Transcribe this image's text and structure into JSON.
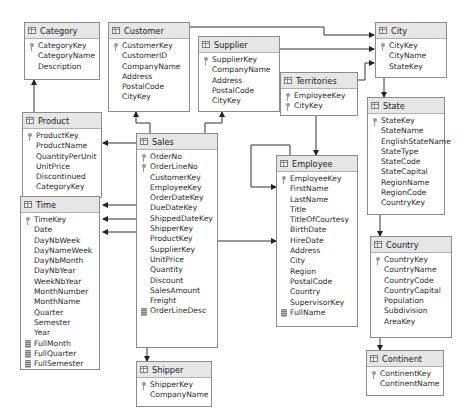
{
  "diagram": {
    "type": "database schema diagram",
    "tables": [
      {
        "id": "category",
        "name": "Category",
        "columns": [
          {
            "name": "CategoryKey",
            "icon": "key-icon"
          },
          {
            "name": "CategoryName",
            "icon": ""
          },
          {
            "name": "Description",
            "icon": ""
          }
        ]
      },
      {
        "id": "customer",
        "name": "Customer",
        "columns": [
          {
            "name": "CustomerKey",
            "icon": "key-icon"
          },
          {
            "name": "CustomerID",
            "icon": ""
          },
          {
            "name": "CompanyName",
            "icon": ""
          },
          {
            "name": "Address",
            "icon": ""
          },
          {
            "name": "PostalCode",
            "icon": ""
          },
          {
            "name": "CityKey",
            "icon": ""
          }
        ]
      },
      {
        "id": "supplier",
        "name": "Supplier",
        "columns": [
          {
            "name": "SupplierKey",
            "icon": "key-icon"
          },
          {
            "name": "CompanyName",
            "icon": ""
          },
          {
            "name": "Address",
            "icon": ""
          },
          {
            "name": "PostalCode",
            "icon": ""
          },
          {
            "name": "CityKey",
            "icon": ""
          }
        ]
      },
      {
        "id": "city",
        "name": "City",
        "columns": [
          {
            "name": "CityKey",
            "icon": "key-icon"
          },
          {
            "name": "CityName",
            "icon": ""
          },
          {
            "name": "StateKey",
            "icon": ""
          }
        ]
      },
      {
        "id": "territories",
        "name": "Territories",
        "columns": [
          {
            "name": "EmployeeKey",
            "icon": "key-icon"
          },
          {
            "name": "CityKey",
            "icon": "key-icon"
          }
        ]
      },
      {
        "id": "product",
        "name": "Product",
        "columns": [
          {
            "name": "ProductKey",
            "icon": "key-icon"
          },
          {
            "name": "ProductName",
            "icon": ""
          },
          {
            "name": "QuantityPerUnit",
            "icon": ""
          },
          {
            "name": "UnitPrice",
            "icon": ""
          },
          {
            "name": "Discontinued",
            "icon": ""
          },
          {
            "name": "CategoryKey",
            "icon": ""
          }
        ]
      },
      {
        "id": "sales",
        "name": "Sales",
        "columns": [
          {
            "name": "OrderNo",
            "icon": "key-icon"
          },
          {
            "name": "OrderLineNo",
            "icon": "key-icon"
          },
          {
            "name": "CustomerKey",
            "icon": ""
          },
          {
            "name": "EmployeeKey",
            "icon": ""
          },
          {
            "name": "OrderDateKey",
            "icon": ""
          },
          {
            "name": "DueDateKey",
            "icon": ""
          },
          {
            "name": "ShippedDateKey",
            "icon": ""
          },
          {
            "name": "ShipperKey",
            "icon": ""
          },
          {
            "name": "ProductKey",
            "icon": ""
          },
          {
            "name": "SupplierKey",
            "icon": ""
          },
          {
            "name": "UnitPrice",
            "icon": ""
          },
          {
            "name": "Quantity",
            "icon": ""
          },
          {
            "name": "Discount",
            "icon": ""
          },
          {
            "name": "SalesAmount",
            "icon": ""
          },
          {
            "name": "Freight",
            "icon": ""
          },
          {
            "name": "OrderLineDesc",
            "icon": "computed-column-icon"
          }
        ]
      },
      {
        "id": "state",
        "name": "State",
        "columns": [
          {
            "name": "StateKey",
            "icon": "key-icon"
          },
          {
            "name": "StateName",
            "icon": ""
          },
          {
            "name": "EnglishStateName",
            "icon": ""
          },
          {
            "name": "StateType",
            "icon": ""
          },
          {
            "name": "StateCode",
            "icon": ""
          },
          {
            "name": "StateCapital",
            "icon": ""
          },
          {
            "name": "RegionName",
            "icon": ""
          },
          {
            "name": "RegionCode",
            "icon": ""
          },
          {
            "name": "CountryKey",
            "icon": ""
          }
        ]
      },
      {
        "id": "employee",
        "name": "Employee",
        "columns": [
          {
            "name": "EmployeeKey",
            "icon": "key-icon"
          },
          {
            "name": "FirstName",
            "icon": ""
          },
          {
            "name": "LastName",
            "icon": ""
          },
          {
            "name": "Title",
            "icon": ""
          },
          {
            "name": "TitleOfCourtesy",
            "icon": ""
          },
          {
            "name": "BirthDate",
            "icon": ""
          },
          {
            "name": "HireDate",
            "icon": ""
          },
          {
            "name": "Address",
            "icon": ""
          },
          {
            "name": "City",
            "icon": ""
          },
          {
            "name": "Region",
            "icon": ""
          },
          {
            "name": "PostalCode",
            "icon": ""
          },
          {
            "name": "Country",
            "icon": ""
          },
          {
            "name": "SupervisorKey",
            "icon": ""
          },
          {
            "name": "FullName",
            "icon": "computed-column-icon"
          }
        ]
      },
      {
        "id": "time",
        "name": "Time",
        "columns": [
          {
            "name": "TimeKey",
            "icon": "key-icon"
          },
          {
            "name": "Date",
            "icon": ""
          },
          {
            "name": "DayNbWeek",
            "icon": ""
          },
          {
            "name": "DayNameWeek",
            "icon": ""
          },
          {
            "name": "DayNbMonth",
            "icon": ""
          },
          {
            "name": "DayNbYear",
            "icon": ""
          },
          {
            "name": "WeekNbYear",
            "icon": ""
          },
          {
            "name": "MonthNumber",
            "icon": ""
          },
          {
            "name": "MonthName",
            "icon": ""
          },
          {
            "name": "Quarter",
            "icon": ""
          },
          {
            "name": "Semester",
            "icon": ""
          },
          {
            "name": "Year",
            "icon": ""
          },
          {
            "name": "FullMonth",
            "icon": "computed-column-icon"
          },
          {
            "name": "FullQuarter",
            "icon": "computed-column-icon"
          },
          {
            "name": "FullSemester",
            "icon": "computed-column-icon"
          }
        ]
      },
      {
        "id": "country",
        "name": "Country",
        "columns": [
          {
            "name": "CountryKey",
            "icon": "key-icon"
          },
          {
            "name": "CountryName",
            "icon": ""
          },
          {
            "name": "CountryCode",
            "icon": ""
          },
          {
            "name": "CountryCapital",
            "icon": ""
          },
          {
            "name": "Population",
            "icon": ""
          },
          {
            "name": "Subdivision",
            "icon": ""
          },
          {
            "name": "AreaKey",
            "icon": ""
          }
        ]
      },
      {
        "id": "shipper",
        "name": "Shipper",
        "columns": [
          {
            "name": "ShipperKey",
            "icon": "key-icon"
          },
          {
            "name": "CompanyName",
            "icon": ""
          }
        ]
      },
      {
        "id": "continent",
        "name": "Continent",
        "columns": [
          {
            "name": "ContinentKey",
            "icon": "key-icon"
          },
          {
            "name": "ContinentName",
            "icon": ""
          }
        ]
      }
    ],
    "relationships": [
      {
        "from": "product",
        "to": "category"
      },
      {
        "from": "sales",
        "to": "customer"
      },
      {
        "from": "sales",
        "to": "supplier"
      },
      {
        "from": "sales",
        "to": "product"
      },
      {
        "from": "sales",
        "to": "time",
        "label": "OrderDateKey"
      },
      {
        "from": "sales",
        "to": "time",
        "label": "DueDateKey"
      },
      {
        "from": "sales",
        "to": "time",
        "label": "ShippedDateKey"
      },
      {
        "from": "sales",
        "to": "shipper"
      },
      {
        "from": "sales",
        "to": "employee"
      },
      {
        "from": "customer",
        "to": "city"
      },
      {
        "from": "supplier",
        "to": "city"
      },
      {
        "from": "territories",
        "to": "city"
      },
      {
        "from": "territories",
        "to": "employee"
      },
      {
        "from": "employee",
        "to": "employee",
        "label": "SupervisorKey"
      },
      {
        "from": "city",
        "to": "state"
      },
      {
        "from": "state",
        "to": "country"
      },
      {
        "from": "country",
        "to": "continent"
      }
    ]
  }
}
